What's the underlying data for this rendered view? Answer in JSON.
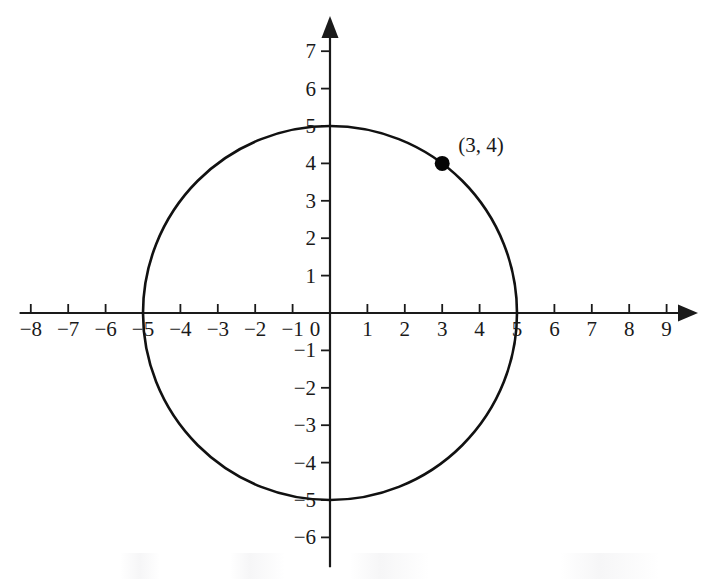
{
  "figure": {
    "type": "coordinate-plane",
    "background_color": "#ffffff",
    "ink_color": "#1a1a1a",
    "curve_color": "#111111"
  },
  "chart_data": {
    "type": "scatter",
    "title": "",
    "subtitle": "",
    "xlabel": "",
    "ylabel": "",
    "grid": false,
    "legend": null,
    "xlim": [
      -8.5,
      9.5
    ],
    "ylim": [
      -6.5,
      7.5
    ],
    "x_ticks": [
      -8,
      -7,
      -6,
      -5,
      -4,
      -3,
      -2,
      -1,
      1,
      2,
      3,
      4,
      5,
      6,
      7,
      8,
      9
    ],
    "y_ticks": [
      7,
      6,
      5,
      4,
      3,
      2,
      1,
      -1,
      -2,
      -3,
      -4,
      -5,
      -6
    ],
    "x_tick_labels": [
      "−8",
      "−7",
      "−6",
      "−5",
      "−4",
      "−3",
      "−2",
      "−1",
      "1",
      "2",
      "3",
      "4",
      "5",
      "6",
      "7",
      "8",
      "9"
    ],
    "y_tick_labels": [
      "7",
      "6",
      "5",
      "4",
      "3",
      "2",
      "1",
      "−1",
      "−2",
      "−3",
      "−4",
      "−5",
      "−6"
    ],
    "origin_label": "0",
    "shapes": [
      {
        "kind": "circle",
        "center": [
          0,
          0
        ],
        "radius": 5,
        "equation": "x^2 + y^2 = 25",
        "stroke": "#111111"
      }
    ],
    "points": [
      {
        "x": 3,
        "y": 4,
        "label": "(3, 4)",
        "marker": "filled-circle",
        "color": "#050505"
      }
    ],
    "axes": {
      "x_axis_arrow": "right",
      "y_axis_arrow": "up",
      "x_axis_range_drawn": [
        -8.3,
        9.75
      ],
      "y_axis_range_drawn": [
        -6.8,
        7.95
      ]
    }
  },
  "annotations": {
    "point_label_text": "(3, 4)"
  }
}
